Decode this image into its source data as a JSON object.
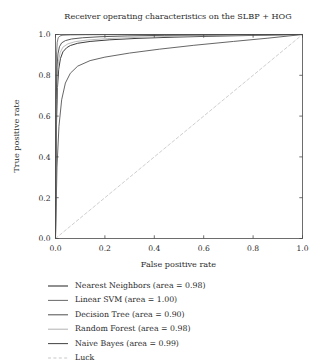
{
  "chart_data": {
    "type": "line",
    "title": "Receiver operating characteristics on the SLBP + HOG",
    "xlabel": "False positive rate",
    "ylabel": "True positive rate",
    "xlim": [
      0.0,
      1.0
    ],
    "ylim": [
      0.0,
      1.0
    ],
    "xticks": [
      0.0,
      0.2,
      0.4,
      0.6,
      0.8,
      1.0
    ],
    "yticks": [
      0.0,
      0.2,
      0.4,
      0.6,
      0.8,
      1.0
    ],
    "xticklabels": [
      "0.0",
      "0.2",
      "0.4",
      "0.6",
      "0.8",
      "1.0"
    ],
    "yticklabels": [
      "0.0",
      "0.2",
      "0.4",
      "0.6",
      "0.8",
      "1.0"
    ],
    "grid": false,
    "legend_position": "below-plot",
    "series": [
      {
        "name": "Nearest Neighbors",
        "area": 0.98,
        "legend_label": "Nearest Neighbors (area = 0.98)",
        "color": "#3d3d3d",
        "width": 1.0,
        "dash": "none",
        "x": [
          0.0,
          0.004,
          0.008,
          0.013,
          0.02,
          0.03,
          0.045,
          0.06,
          0.09,
          0.14,
          0.22,
          0.33,
          0.48,
          0.65,
          0.82,
          1.0
        ],
        "y": [
          0.0,
          0.56,
          0.74,
          0.83,
          0.882,
          0.915,
          0.935,
          0.946,
          0.957,
          0.966,
          0.974,
          0.981,
          0.987,
          0.992,
          0.996,
          1.0
        ]
      },
      {
        "name": "Linear SVM",
        "area": 1.0,
        "legend_label": "Linear SVM (area = 1.00)",
        "color": "#6e6e6e",
        "width": 0.9,
        "dash": "none",
        "x": [
          0.0,
          0.002,
          0.004,
          0.007,
          0.011,
          0.018,
          0.03,
          0.06,
          0.12,
          0.25,
          0.45,
          0.7,
          1.0
        ],
        "y": [
          0.0,
          0.72,
          0.9,
          0.962,
          0.984,
          0.993,
          0.9965,
          0.998,
          0.9988,
          0.9993,
          0.9996,
          0.9998,
          1.0
        ]
      },
      {
        "name": "Decision Tree",
        "area": 0.9,
        "legend_label": "Decision Tree (area = 0.90)",
        "color": "#555555",
        "width": 0.9,
        "dash": "none",
        "x": [
          0.0,
          0.006,
          0.014,
          0.025,
          0.04,
          0.06,
          0.09,
          0.14,
          0.2,
          0.3,
          0.42,
          0.56,
          0.72,
          0.86,
          1.0
        ],
        "y": [
          0.0,
          0.35,
          0.55,
          0.68,
          0.762,
          0.81,
          0.845,
          0.872,
          0.889,
          0.909,
          0.928,
          0.947,
          0.966,
          0.982,
          1.0
        ]
      },
      {
        "name": "Random Forest",
        "area": 0.98,
        "legend_label": "Random Forest (area = 0.98)",
        "color": "#b4b4b4",
        "width": 0.9,
        "dash": "none",
        "x": [
          0.0,
          0.003,
          0.007,
          0.012,
          0.019,
          0.03,
          0.05,
          0.08,
          0.13,
          0.21,
          0.33,
          0.48,
          0.66,
          0.84,
          1.0
        ],
        "y": [
          0.0,
          0.62,
          0.79,
          0.868,
          0.912,
          0.938,
          0.954,
          0.965,
          0.973,
          0.98,
          0.986,
          0.991,
          0.995,
          0.998,
          1.0
        ]
      },
      {
        "name": "Naive Bayes",
        "area": 0.99,
        "legend_label": "Naive Bayes (area = 0.99)",
        "color": "#484848",
        "width": 0.9,
        "dash": "none",
        "x": [
          0.0,
          0.003,
          0.006,
          0.01,
          0.016,
          0.025,
          0.04,
          0.065,
          0.11,
          0.18,
          0.29,
          0.44,
          0.62,
          0.81,
          1.0
        ],
        "y": [
          0.0,
          0.68,
          0.84,
          0.905,
          0.94,
          0.959,
          0.97,
          0.978,
          0.984,
          0.989,
          0.993,
          0.996,
          0.998,
          0.999,
          1.0
        ]
      },
      {
        "name": "Luck",
        "area": null,
        "legend_label": "Luck",
        "color": "#c8c8c8",
        "width": 0.9,
        "dash": "3,2.4",
        "x": [
          0.0,
          1.0
        ],
        "y": [
          0.0,
          1.0
        ]
      }
    ]
  }
}
